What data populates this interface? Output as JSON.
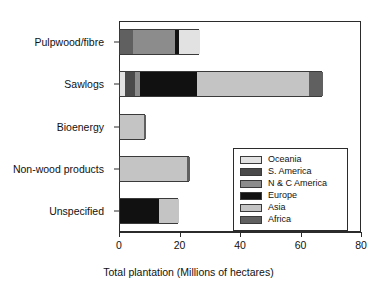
{
  "chart_data": {
    "type": "bar",
    "orientation": "horizontal",
    "stacked": true,
    "title": "",
    "xlabel": "Total plantation (Millions of hectares)",
    "ylabel": "",
    "xlim": [
      0,
      80
    ],
    "xticks": [
      0,
      20,
      40,
      60,
      80
    ],
    "xticklabels": [
      "0",
      "20",
      "40",
      "60",
      "80"
    ],
    "grid": false,
    "legend_position": "lower right",
    "categories": [
      "Pulpwood/fibre",
      "Sawlogs",
      "Bioenergy",
      "Non-wood products",
      "Unspecified"
    ],
    "series": [
      {
        "name": "Oceania",
        "color": "#e2e2e2",
        "values": [
          7.0,
          1.6,
          0.0,
          0.0,
          0.0
        ]
      },
      {
        "name": "S. America",
        "color": "#4a4a4a",
        "values": [
          0.0,
          3.2,
          0.0,
          0.0,
          0.0
        ]
      },
      {
        "name": "N & C America",
        "color": "#8c8c8c",
        "values": [
          14.0,
          1.8,
          0.0,
          0.0,
          0.0
        ]
      },
      {
        "name": "Europe",
        "color": "#111111",
        "values": [
          1.4,
          19.0,
          0.0,
          0.0,
          13.0
        ]
      },
      {
        "name": "Asia",
        "color": "#c4c4c4",
        "values": [
          0.0,
          37.0,
          8.0,
          22.0,
          6.5
        ]
      },
      {
        "name": "Africa",
        "color": "#606060",
        "values": [
          4.2,
          4.4,
          0.5,
          1.0,
          0.0
        ]
      }
    ],
    "bars": [
      {
        "category": "Pulpwood/fibre",
        "total": 26.6,
        "segments": [
          {
            "series": "Africa",
            "start": 0.0,
            "end": 4.2,
            "value": 4.2,
            "color": "#606060"
          },
          {
            "series": "N & C America",
            "start": 4.2,
            "end": 18.2,
            "value": 14.0,
            "color": "#8c8c8c"
          },
          {
            "series": "Europe",
            "start": 18.2,
            "end": 19.6,
            "value": 1.4,
            "color": "#111111"
          },
          {
            "series": "Oceania",
            "start": 19.6,
            "end": 26.6,
            "value": 7.0,
            "color": "#e2e2e2"
          }
        ]
      },
      {
        "category": "Sawlogs",
        "total": 67.0,
        "segments": [
          {
            "series": "Oceania",
            "start": 0.0,
            "end": 1.6,
            "value": 1.6,
            "color": "#e2e2e2"
          },
          {
            "series": "S. America",
            "start": 1.6,
            "end": 4.8,
            "value": 3.2,
            "color": "#4a4a4a"
          },
          {
            "series": "N & C America",
            "start": 4.8,
            "end": 6.6,
            "value": 1.8,
            "color": "#8c8c8c"
          },
          {
            "series": "Europe",
            "start": 6.6,
            "end": 25.6,
            "value": 19.0,
            "color": "#111111"
          },
          {
            "series": "Asia",
            "start": 25.6,
            "end": 62.6,
            "value": 37.0,
            "color": "#c4c4c4"
          },
          {
            "series": "Africa",
            "start": 62.6,
            "end": 67.0,
            "value": 4.4,
            "color": "#606060"
          }
        ]
      },
      {
        "category": "Bioenergy",
        "total": 8.5,
        "segments": [
          {
            "series": "Asia",
            "start": 0.0,
            "end": 8.0,
            "value": 8.0,
            "color": "#c4c4c4"
          },
          {
            "series": "Africa",
            "start": 8.0,
            "end": 8.5,
            "value": 0.5,
            "color": "#606060"
          }
        ]
      },
      {
        "category": "Non-wood products",
        "total": 23.0,
        "segments": [
          {
            "series": "Asia",
            "start": 0.0,
            "end": 22.0,
            "value": 22.0,
            "color": "#c4c4c4"
          },
          {
            "series": "Africa",
            "start": 22.0,
            "end": 23.0,
            "value": 1.0,
            "color": "#606060"
          }
        ]
      },
      {
        "category": "Unspecified",
        "total": 19.5,
        "segments": [
          {
            "series": "Europe",
            "start": 0.0,
            "end": 13.0,
            "value": 13.0,
            "color": "#111111"
          },
          {
            "series": "Asia",
            "start": 13.0,
            "end": 19.5,
            "value": 6.5,
            "color": "#c4c4c4"
          }
        ]
      }
    ]
  },
  "legend": {
    "entries": [
      {
        "label": "Oceania",
        "color": "#e2e2e2"
      },
      {
        "label": "S. America",
        "color": "#4a4a4a"
      },
      {
        "label": "N & C America",
        "color": "#8c8c8c"
      },
      {
        "label": "Europe",
        "color": "#111111"
      },
      {
        "label": "Asia",
        "color": "#c4c4c4"
      },
      {
        "label": "Africa",
        "color": "#606060"
      }
    ]
  },
  "axis": {
    "x_title": "Total plantation (Millions of hectares)",
    "x_tick_labels": [
      "0",
      "20",
      "40",
      "60",
      "80"
    ],
    "y_tick_labels": [
      "Pulpwood/fibre",
      "Sawlogs",
      "Bioenergy",
      "Non-wood products",
      "Unspecified"
    ]
  }
}
